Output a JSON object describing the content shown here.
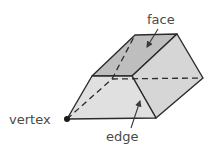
{
  "diagram": {
    "labels": {
      "face": "face",
      "vertex": "vertex",
      "edge": "edge"
    },
    "colors": {
      "top_face": "#bebebe",
      "right_face": "#d6d6d6",
      "front_face": "#e0e0e0",
      "stroke": "#2b2b2b",
      "text": "#4a4a4a"
    }
  }
}
